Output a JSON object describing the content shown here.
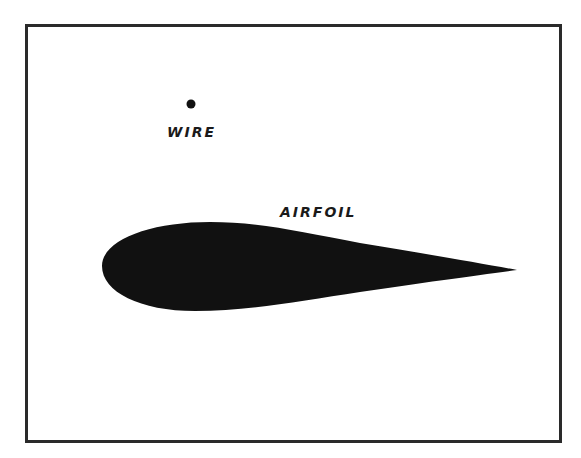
{
  "diagram": {
    "labels": {
      "wire": "WIRE",
      "airfoil": "AIRFOIL"
    },
    "colors": {
      "frame": "#2a2a2a",
      "ink": "#111111",
      "background": "#ffffff"
    }
  }
}
